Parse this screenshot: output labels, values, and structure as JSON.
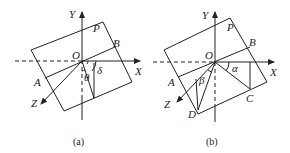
{
  "figure": {
    "panels": [
      {
        "id": "a",
        "caption": "(a)",
        "labels": {
          "Y": "Y",
          "X": "X",
          "Z": "Z",
          "O": "O",
          "P": "P",
          "A": "A",
          "B": "B",
          "delta": "δ",
          "theta": "θ"
        }
      },
      {
        "id": "b",
        "caption": "(b)",
        "labels": {
          "Y": "Y",
          "X": "X",
          "Z": "Z",
          "O": "O",
          "P": "P",
          "A": "A",
          "B": "B",
          "C": "C",
          "D": "D",
          "alpha": "α",
          "beta": "β"
        }
      }
    ]
  }
}
